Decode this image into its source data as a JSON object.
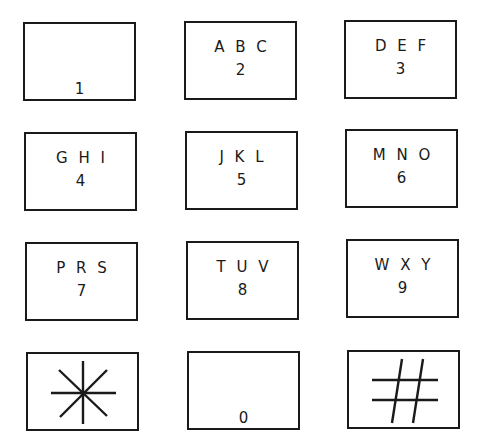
{
  "keypad": {
    "title": "Telephone keypad",
    "line_color": "#1a1a1a",
    "background": "#ffffff",
    "keys": [
      {
        "digit": "1",
        "letters": "",
        "x": 23,
        "y": 22
      },
      {
        "digit": "2",
        "letters": "A B C",
        "x": 184,
        "y": 21
      },
      {
        "digit": "3",
        "letters": "D E F",
        "x": 344,
        "y": 20
      },
      {
        "digit": "4",
        "letters": "G H I",
        "x": 24,
        "y": 132
      },
      {
        "digit": "5",
        "letters": "J K L",
        "x": 185,
        "y": 131
      },
      {
        "digit": "6",
        "letters": "M N O",
        "x": 345,
        "y": 129
      },
      {
        "digit": "7",
        "letters": "P R S",
        "x": 25,
        "y": 242
      },
      {
        "digit": "8",
        "letters": "T U V",
        "x": 186,
        "y": 241
      },
      {
        "digit": "9",
        "letters": "W X Y",
        "x": 346,
        "y": 239
      },
      {
        "digit": "*",
        "letters": "",
        "symbol": "asterisk",
        "x": 26,
        "y": 352
      },
      {
        "digit": "0",
        "letters": "",
        "x": 187,
        "y": 351
      },
      {
        "digit": "#",
        "letters": "",
        "symbol": "hash",
        "x": 347,
        "y": 350
      }
    ]
  }
}
